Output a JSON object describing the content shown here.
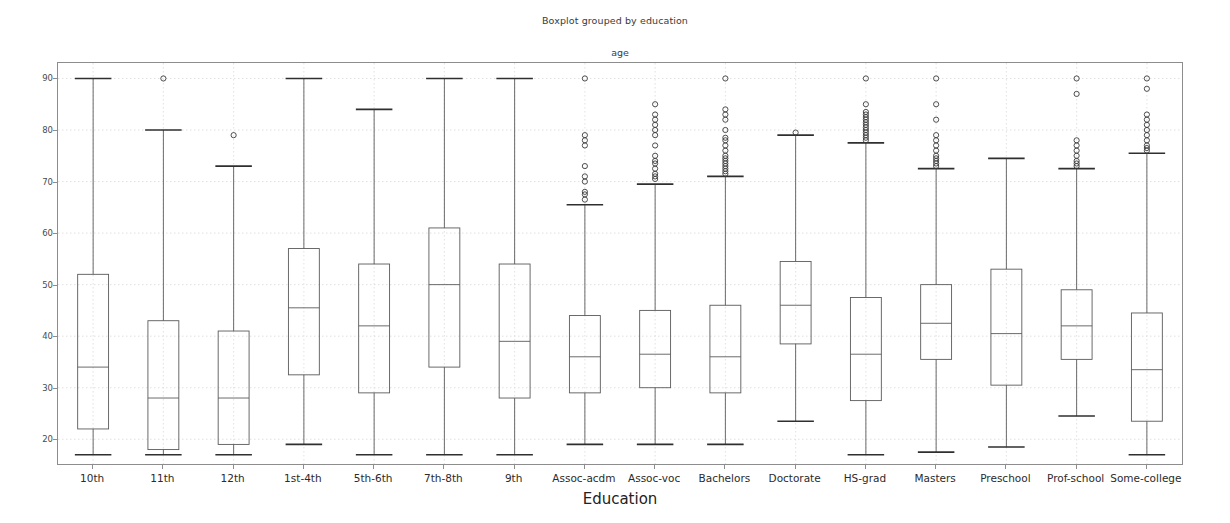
{
  "figure": {
    "suptitle": "Boxplot grouped by education",
    "axes_title": "age",
    "xlabel": "Education",
    "ylabel": ""
  },
  "chart_data": {
    "type": "box",
    "title": "Boxplot grouped by education",
    "subplot_title": "age",
    "xlabel": "Education",
    "ylabel": "",
    "ylim": [
      15.2,
      93.0
    ],
    "yticks": [
      20,
      30,
      40,
      50,
      60,
      70,
      80,
      90
    ],
    "ytick_labels": [
      "20",
      "30",
      "40",
      "50",
      "60",
      "70",
      "80",
      "90"
    ],
    "grid": true,
    "legend": "none",
    "box_color": "#5a5a5a",
    "median_color": "#5a5a5a",
    "whisker_color": "#5a5a5a",
    "flier_color": "#3a3a3a",
    "grid_color": "#d9d9d9",
    "categories": [
      "10th",
      "11th",
      "12th",
      "1st-4th",
      "5th-6th",
      "7th-8th",
      "9th",
      "Assoc-acdm",
      "Assoc-voc",
      "Bachelors",
      "Doctorate",
      "HS-grad",
      "Masters",
      "Preschool",
      "Prof-school",
      "Some-college"
    ],
    "boxes": [
      {
        "label": "10th",
        "whisker_low": 17.0,
        "q1": 22.0,
        "median": 34.0,
        "q3": 52.0,
        "whisker_high": 90.0,
        "outliers": []
      },
      {
        "label": "11th",
        "whisker_low": 17.0,
        "q1": 18.0,
        "median": 28.0,
        "q3": 43.0,
        "whisker_high": 80.0,
        "outliers": [
          90.0
        ]
      },
      {
        "label": "12th",
        "whisker_low": 17.0,
        "q1": 19.0,
        "median": 28.0,
        "q3": 41.0,
        "whisker_high": 73.0,
        "outliers": [
          79.0
        ]
      },
      {
        "label": "1st-4th",
        "whisker_low": 19.0,
        "q1": 32.5,
        "median": 45.5,
        "q3": 57.0,
        "whisker_high": 90.0,
        "outliers": []
      },
      {
        "label": "5th-6th",
        "whisker_low": 17.0,
        "q1": 29.0,
        "median": 42.0,
        "q3": 54.0,
        "whisker_high": 84.0,
        "outliers": []
      },
      {
        "label": "7th-8th",
        "whisker_low": 17.0,
        "q1": 34.0,
        "median": 50.0,
        "q3": 61.0,
        "whisker_high": 90.0,
        "outliers": []
      },
      {
        "label": "9th",
        "whisker_low": 17.0,
        "q1": 28.0,
        "median": 39.0,
        "q3": 54.0,
        "whisker_high": 90.0,
        "outliers": []
      },
      {
        "label": "Assoc-acdm",
        "whisker_low": 19.0,
        "q1": 29.0,
        "median": 36.0,
        "q3": 44.0,
        "whisker_high": 65.5,
        "outliers": [
          90.0,
          79.0,
          78.0,
          77.0,
          73.0,
          71.0,
          70.0,
          68.0,
          67.5,
          66.5
        ]
      },
      {
        "label": "Assoc-voc",
        "whisker_low": 19.0,
        "q1": 30.0,
        "median": 36.5,
        "q3": 45.0,
        "whisker_high": 69.5,
        "outliers": [
          85.0,
          83.0,
          82.0,
          81.0,
          80.0,
          79.0,
          77.0,
          75.0,
          74.0,
          73.5,
          72.5,
          71.5,
          71.0,
          70.5
        ]
      },
      {
        "label": "Bachelors",
        "whisker_low": 19.0,
        "q1": 29.0,
        "median": 36.0,
        "q3": 46.0,
        "whisker_high": 71.0,
        "outliers": [
          90.0,
          84.0,
          83.0,
          82.0,
          80.0,
          78.5,
          78.0,
          77.0,
          76.0,
          75.0,
          74.5,
          74.0,
          73.5,
          73.0,
          72.5,
          72.0,
          71.5
        ]
      },
      {
        "label": "Doctorate",
        "whisker_low": 23.5,
        "q1": 38.5,
        "median": 46.0,
        "q3": 54.5,
        "whisker_high": 79.0,
        "outliers": [
          79.5
        ]
      },
      {
        "label": "HS-grad",
        "whisker_low": 17.0,
        "q1": 27.5,
        "median": 36.5,
        "q3": 47.5,
        "whisker_high": 77.5,
        "outliers": [
          90.0,
          85.0,
          83.5,
          83.0,
          82.5,
          82.0,
          81.5,
          81.0,
          80.5,
          80.0,
          79.5,
          79.0,
          78.5,
          78.0
        ]
      },
      {
        "label": "Masters",
        "whisker_low": 17.5,
        "q1": 35.5,
        "median": 42.5,
        "q3": 50.0,
        "whisker_high": 72.5,
        "outliers": [
          90.0,
          85.0,
          82.0,
          79.0,
          78.0,
          77.0,
          76.0,
          75.0,
          74.5,
          74.0,
          73.5,
          73.0
        ]
      },
      {
        "label": "Preschool",
        "whisker_low": 18.5,
        "q1": 30.5,
        "median": 40.5,
        "q3": 53.0,
        "whisker_high": 74.5,
        "outliers": []
      },
      {
        "label": "Prof-school",
        "whisker_low": 24.5,
        "q1": 35.5,
        "median": 42.0,
        "q3": 49.0,
        "whisker_high": 72.5,
        "outliers": [
          90.0,
          87.0,
          78.0,
          77.0,
          76.0,
          75.0,
          74.0,
          73.5,
          73.0
        ]
      },
      {
        "label": "Some-college",
        "whisker_low": 17.0,
        "q1": 23.5,
        "median": 33.5,
        "q3": 44.5,
        "whisker_high": 75.5,
        "outliers": [
          90.0,
          88.0,
          83.0,
          82.0,
          81.0,
          80.0,
          79.0,
          78.0,
          77.0,
          76.5,
          76.0
        ]
      }
    ]
  }
}
